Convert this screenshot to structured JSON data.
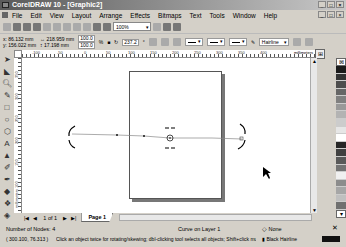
{
  "window": {
    "title": "CorelDRAW 10 - [Graphic2]",
    "controls": [
      "_",
      "□",
      "×"
    ],
    "doc_controls": [
      "_",
      "□",
      "×"
    ]
  },
  "menubar": {
    "items": [
      "File",
      "Edit",
      "View",
      "Layout",
      "Arrange",
      "Effects",
      "Bitmaps",
      "Text",
      "Tools",
      "Window",
      "Help"
    ]
  },
  "toolbar": {
    "zoom_level": "100%",
    "icons": [
      "new-icon",
      "open-icon",
      "save-icon",
      "print-icon",
      "cut-icon",
      "copy-icon",
      "paste-icon",
      "undo-icon",
      "redo-icon",
      "import-icon",
      "export-icon",
      "zoom-level-dropdown",
      "application-launcher-icon",
      "corel-online-icon",
      "whats-this-icon"
    ]
  },
  "property_bar": {
    "x": "86.132 mm",
    "y": "156.022 mm",
    "width": "218.959 mm",
    "height": "17.198 mm",
    "scale_x": "100.0",
    "scale_y": "100.0",
    "scale_unit": "%",
    "rotation": "237.2",
    "rotation_unit": "°",
    "outline_width": "Hairline"
  },
  "ruler": {
    "units": "millimeters",
    "h_ticks": [
      "-100",
      "-50",
      "0",
      "50",
      "100",
      "150",
      "200",
      "250",
      "300",
      "350",
      "400",
      "450"
    ],
    "v_ticks": [
      "350",
      "300",
      "250",
      "200",
      "150",
      "100",
      "50"
    ]
  },
  "toolbox": {
    "tools": [
      "pick-tool",
      "shape-tool",
      "zoom-tool",
      "freehand-tool",
      "rectangle-tool",
      "ellipse-tool",
      "polygon-tool",
      "text-tool",
      "interactive-fill-tool",
      "eyedropper-tool",
      "outline-tool",
      "fill-tool",
      "interactive-blend-tool",
      "transparency-tool"
    ]
  },
  "palette": {
    "swatches": [
      "#1a1a1a",
      "#333333",
      "#4d4d4d",
      "#666666",
      "#808080",
      "#999999",
      "#b3b3b3",
      "#cccccc",
      "#e6e6e6",
      "#ffffff",
      "#262626",
      "#404040",
      "#595959",
      "#737373",
      "#f0f0f0",
      "#8c8c8c",
      "#a6a6a6",
      "#bfbfbf",
      "#d9d9d9",
      "#707070"
    ]
  },
  "page_nav": {
    "counter": "1 of 1",
    "tab_label": "Page 1"
  },
  "status": {
    "nodes": "Number of Nodes: 4",
    "object_info": "Curve on Layer 1",
    "fill": "None",
    "cursor_pos": "( 300.100, 76.313 )",
    "hint": "Click an object twice for rotating/skewing; dbl-clicking tool selects all objects; Shift+click multi-sele...",
    "outline": "Black  Hairline"
  }
}
